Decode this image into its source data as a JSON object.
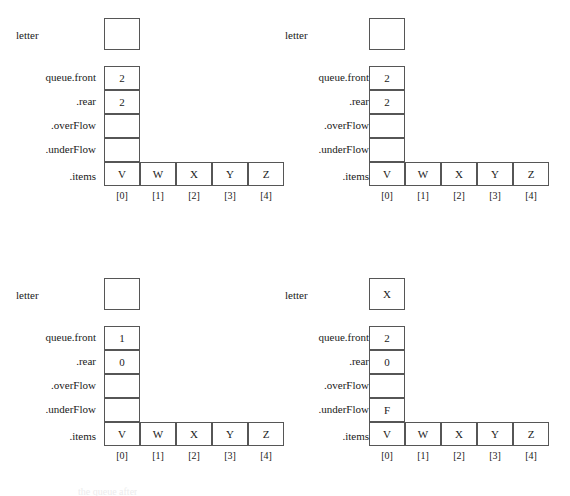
{
  "figure": {
    "labels": {
      "letter": "letter",
      "front": "queue.front",
      "rear": ".rear",
      "overflow": ".overFlow",
      "underflow": ".underFlow",
      "items": ".items"
    },
    "indices": [
      "[0]",
      "[1]",
      "[2]",
      "[3]",
      "[4]"
    ],
    "caption_remnant": "the queue after"
  },
  "panels": [
    {
      "position": "top-left",
      "letter": "",
      "front": "2",
      "rear": "2",
      "overflow": "",
      "underflow": "",
      "items": [
        "V",
        "W",
        "X",
        "Y",
        "Z"
      ]
    },
    {
      "position": "top-right",
      "letter": "",
      "front": "2",
      "rear": "2",
      "overflow": "",
      "underflow": "",
      "items": [
        "V",
        "W",
        "X",
        "Y",
        "Z"
      ]
    },
    {
      "position": "bottom-left",
      "letter": "",
      "front": "1",
      "rear": "0",
      "overflow": "",
      "underflow": "",
      "items": [
        "V",
        "W",
        "X",
        "Y",
        "Z"
      ]
    },
    {
      "position": "bottom-right",
      "letter": "X",
      "front": "2",
      "rear": "0",
      "overflow": "",
      "underflow": "F",
      "items": [
        "V",
        "W",
        "X",
        "Y",
        "Z"
      ]
    }
  ],
  "colors": {
    "background": "#ffffff",
    "border": "#565656",
    "text": "#1a1a1a"
  }
}
